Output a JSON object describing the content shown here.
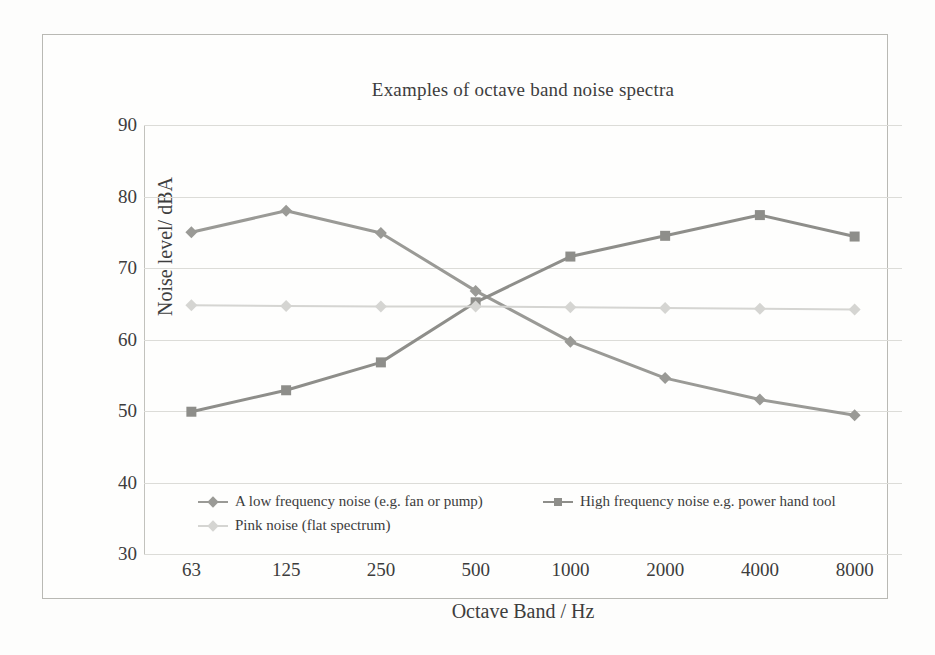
{
  "chart_data": {
    "type": "line",
    "title": "Examples of octave band noise spectra",
    "xlabel": "Octave Band / Hz",
    "ylabel": "Noise level/ dBA",
    "categories": [
      "63",
      "125",
      "250",
      "500",
      "1000",
      "2000",
      "4000",
      "8000"
    ],
    "ylim": [
      30,
      90
    ],
    "yticks": [
      "30",
      "40",
      "50",
      "60",
      "70",
      "80",
      "90"
    ],
    "grid": true,
    "legend_position": "bottom",
    "series": [
      {
        "name": "A low frequency noise (e.g. fan or pump)",
        "marker": "diamond",
        "color": "#9a9a96",
        "values": [
          75.0,
          78.0,
          74.9,
          66.8,
          59.7,
          54.6,
          51.6,
          49.4
        ]
      },
      {
        "name": "High frequency noise e.g. power hand tool",
        "marker": "square",
        "color": "#8e8e8a",
        "values": [
          49.9,
          52.9,
          56.8,
          65.2,
          71.6,
          74.5,
          77.4,
          74.4
        ]
      },
      {
        "name": "Pink noise (flat spectrum)",
        "marker": "diamond",
        "color": "#d5d5d2",
        "values": [
          64.8,
          64.7,
          64.6,
          64.6,
          64.5,
          64.4,
          64.3,
          64.2
        ]
      }
    ]
  }
}
